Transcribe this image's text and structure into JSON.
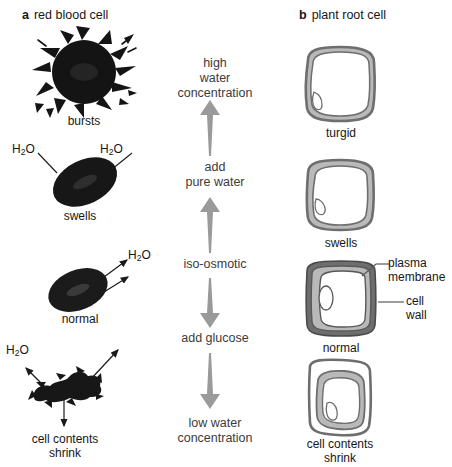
{
  "figure": {
    "panel_a": {
      "marker": "a",
      "title": "red blood cell",
      "cells": [
        {
          "id": "bursts",
          "caption": "bursts",
          "water_labels": []
        },
        {
          "id": "swells",
          "caption": "swells",
          "water_labels": [
            "H2O",
            "H2O"
          ]
        },
        {
          "id": "normal",
          "caption": "normal",
          "water_labels": [
            "H2O"
          ]
        },
        {
          "id": "shrink",
          "caption": "cell contents\nshrink",
          "caption_line1": "cell contents",
          "caption_line2": "shrink",
          "water_labels": [
            "H2O"
          ]
        }
      ]
    },
    "panel_b": {
      "marker": "b",
      "title": "plant root cell",
      "cells": [
        {
          "id": "turgid",
          "caption": "turgid"
        },
        {
          "id": "swells",
          "caption": "swells"
        },
        {
          "id": "normal",
          "caption": "normal"
        },
        {
          "id": "shrink",
          "caption_line1": "cell contents",
          "caption_line2": "shrink"
        }
      ],
      "annotations": [
        {
          "id": "plasma-membrane",
          "line1": "plasma",
          "line2": "membrane"
        },
        {
          "id": "cell-wall",
          "line1": "cell",
          "line2": "wall"
        }
      ]
    },
    "gradient": {
      "top_label_line1": "high",
      "top_label_line2": "water",
      "top_label_line3": "concentration",
      "mid_upper_line1": "add",
      "mid_upper_line2": "pure water",
      "mid_center": "iso-osmotic",
      "mid_lower": "add glucose",
      "bottom_label_line1": "low water",
      "bottom_label_line2": "concentration",
      "arrow_up_count": 2,
      "arrow_down_count": 2
    },
    "water_formula": {
      "prefix": "H",
      "subscript": "2",
      "suffix": "O"
    },
    "colors": {
      "arrow_gray": "#9a9a9a",
      "cell_wall_gray": "#6e6e6e",
      "cytoplasm_gray": "#b9b9b9",
      "rbc_black": "#141414",
      "text": "#161616",
      "gradient_text": "#3b3b3b",
      "leader_line": "#5a5a5a"
    }
  }
}
